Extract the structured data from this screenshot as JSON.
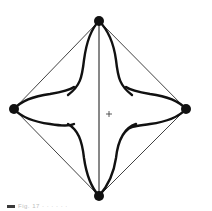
{
  "figure": {
    "background": "#ffffff",
    "stroke_color": "#111111",
    "vertices": {
      "top": {
        "x": 99,
        "y": 21
      },
      "right": {
        "x": 186,
        "y": 109
      },
      "bottom": {
        "x": 99,
        "y": 196
      },
      "left": {
        "x": 14,
        "y": 109
      }
    },
    "center_marker": {
      "x": 109,
      "y": 114,
      "symbol": "+"
    },
    "vertex_radius": 5,
    "diamond_stroke_width": 0.8,
    "axis_stroke_width": 1,
    "star_stroke_width": 2.4
  },
  "caption": {
    "text": "Fig. 17 ·  ·  ·  ·  ·  ·"
  }
}
